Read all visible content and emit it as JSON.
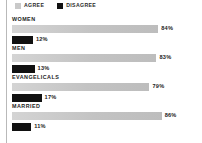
{
  "chart_data": {
    "type": "bar",
    "orientation": "horizontal",
    "title": "",
    "subtitle": "",
    "xlabel": "",
    "ylabel": "",
    "xlim": [
      0,
      100
    ],
    "grid": false,
    "legend_position": "top-left",
    "categories": [
      "WOMEN",
      "MEN",
      "EVANGELICALS",
      "MARRIED"
    ],
    "series": [
      {
        "name": "AGREE",
        "color": "#c9c9c9",
        "values": [
          84,
          83,
          79,
          86
        ],
        "value_labels": [
          "84%",
          "83%",
          "79%",
          "86%"
        ]
      },
      {
        "name": "DISAGREE",
        "color": "#111111",
        "values": [
          12,
          13,
          17,
          11
        ],
        "value_labels": [
          "12%",
          "13%",
          "17%",
          "11%"
        ]
      }
    ]
  },
  "legend": {
    "items": [
      {
        "label": "AGREE",
        "swatch": "agree"
      },
      {
        "label": "DISAGREE",
        "swatch": "disagree"
      }
    ]
  },
  "groups": [
    {
      "label": "WOMEN",
      "agree": {
        "label": "84%",
        "pct": 84
      },
      "disagree": {
        "label": "12%",
        "pct": 12
      }
    },
    {
      "label": "MEN",
      "agree": {
        "label": "83%",
        "pct": 83
      },
      "disagree": {
        "label": "13%",
        "pct": 13
      }
    },
    {
      "label": "EVANGELICALS",
      "agree": {
        "label": "79%",
        "pct": 79
      },
      "disagree": {
        "label": "17%",
        "pct": 17
      }
    },
    {
      "label": "MARRIED",
      "agree": {
        "label": "86%",
        "pct": 86
      },
      "disagree": {
        "label": "11%",
        "pct": 11
      }
    }
  ],
  "colors": {
    "agree": "#c9c9c9",
    "disagree": "#111111",
    "axis_rule": "#b9b9b9",
    "text": "#1c1c1c",
    "background": "#ffffff"
  },
  "scale": {
    "track_px": 174,
    "max_pct": 100
  }
}
